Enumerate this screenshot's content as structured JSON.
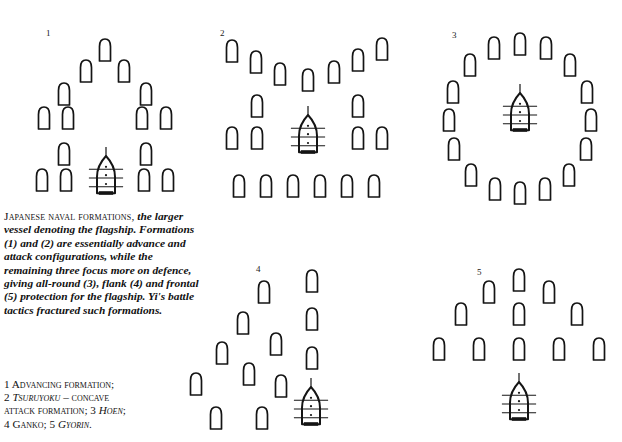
{
  "page": {
    "background_color": "#ffffff",
    "ink_color": "#141414",
    "width": 622,
    "height": 442
  },
  "figure": {
    "title_smallcaps": "Japanese naval formations,",
    "caption_italic": " the larger vessel denoting the flagship. Formations (1) and (2) are essentially advance and attack configurations, while the remaining three focus more on defence, giving all-round (3), flank (4) and frontal (5) protection for the flagship. Yi's battle tactics fractured such formations."
  },
  "legend": {
    "items": [
      {
        "number": "1",
        "name": "Advancing formation",
        "name_style": "smallcaps",
        "suffix": ";"
      },
      {
        "number": "2",
        "name": "Tsuruyoku",
        "name_style": "smallcaps-italic",
        "suffix": " – concave"
      },
      {
        "number": "",
        "name": "attack formation",
        "name_style": "smallcaps",
        "suffix": ";"
      },
      {
        "number": "3",
        "name": "Hoen",
        "name_style": "smallcaps-italic",
        "suffix": ";"
      },
      {
        "number": "4",
        "name": "Ganko",
        "name_style": "smallcaps",
        "suffix": ";"
      },
      {
        "number": "5",
        "name": "Gyorin",
        "name_style": "smallcaps-italic",
        "suffix": "."
      }
    ],
    "line1": "1 Advancing formation;",
    "line2_num": "2 ",
    "line2_it": "Tsuruyoku",
    "line2_rest": " – concave",
    "line3_a": "attack formation; 3 ",
    "line3_it": "Hoen",
    "line3_b": ";",
    "line4_a": "4 Ganko; 5 ",
    "line4_it": "Gyorin",
    "line4_b": "."
  },
  "formations": [
    {
      "id": "formation-1",
      "label": "1",
      "name": "Advancing formation",
      "label_x": 46,
      "label_y": 29,
      "x": 8,
      "y": 18,
      "w": 196,
      "h": 192,
      "flagship": {
        "cx": 98,
        "cy": 158
      },
      "ships": [
        {
          "cx": 97,
          "cy": 32
        },
        {
          "cx": 78,
          "cy": 53
        },
        {
          "cx": 116,
          "cy": 53
        },
        {
          "cx": 56,
          "cy": 76
        },
        {
          "cx": 138,
          "cy": 76
        },
        {
          "cx": 36,
          "cy": 100
        },
        {
          "cx": 60,
          "cy": 100
        },
        {
          "cx": 134,
          "cy": 100
        },
        {
          "cx": 158,
          "cy": 100
        },
        {
          "cx": 56,
          "cy": 136
        },
        {
          "cx": 138,
          "cy": 136
        },
        {
          "cx": 34,
          "cy": 162
        },
        {
          "cx": 58,
          "cy": 162
        },
        {
          "cx": 136,
          "cy": 162
        },
        {
          "cx": 160,
          "cy": 162
        }
      ]
    },
    {
      "id": "formation-2",
      "label": "2",
      "name": "Tsuruyoku – concave attack formation",
      "label_x": 220,
      "label_y": 29,
      "x": 208,
      "y": 18,
      "w": 196,
      "h": 192,
      "flagship": {
        "cx": 100,
        "cy": 117
      },
      "ships": [
        {
          "cx": 24,
          "cy": 33
        },
        {
          "cx": 48,
          "cy": 44
        },
        {
          "cx": 72,
          "cy": 56
        },
        {
          "cx": 100,
          "cy": 62
        },
        {
          "cx": 126,
          "cy": 54
        },
        {
          "cx": 150,
          "cy": 42
        },
        {
          "cx": 174,
          "cy": 31
        },
        {
          "cx": 49,
          "cy": 88
        },
        {
          "cx": 150,
          "cy": 88
        },
        {
          "cx": 24,
          "cy": 120
        },
        {
          "cx": 49,
          "cy": 120
        },
        {
          "cx": 150,
          "cy": 120
        },
        {
          "cx": 174,
          "cy": 120
        },
        {
          "cx": 31,
          "cy": 168
        },
        {
          "cx": 58,
          "cy": 168
        },
        {
          "cx": 85,
          "cy": 168
        },
        {
          "cx": 112,
          "cy": 168
        },
        {
          "cx": 139,
          "cy": 168
        },
        {
          "cx": 166,
          "cy": 168
        }
      ]
    },
    {
      "id": "formation-3",
      "label": "3",
      "name": "Hoen",
      "label_x": 452,
      "label_y": 31,
      "x": 424,
      "y": 18,
      "w": 192,
      "h": 192,
      "flagship": {
        "cx": 96,
        "cy": 95
      },
      "ships": [
        {
          "cx": 96,
          "cy": 26
        },
        {
          "cx": 70,
          "cy": 30
        },
        {
          "cx": 122,
          "cy": 30
        },
        {
          "cx": 46,
          "cy": 47
        },
        {
          "cx": 146,
          "cy": 47
        },
        {
          "cx": 29,
          "cy": 74
        },
        {
          "cx": 163,
          "cy": 74
        },
        {
          "cx": 25,
          "cy": 102
        },
        {
          "cx": 167,
          "cy": 102
        },
        {
          "cx": 30,
          "cy": 131
        },
        {
          "cx": 162,
          "cy": 131
        },
        {
          "cx": 47,
          "cy": 157
        },
        {
          "cx": 145,
          "cy": 157
        },
        {
          "cx": 71,
          "cy": 171
        },
        {
          "cx": 121,
          "cy": 171
        },
        {
          "cx": 96,
          "cy": 175
        }
      ]
    },
    {
      "id": "formation-4",
      "label": "4",
      "name": "Ganko",
      "label_x": 256,
      "label_y": 265,
      "x": 186,
      "y": 252,
      "w": 192,
      "h": 190,
      "flagship": {
        "cx": 125,
        "cy": 155
      },
      "ships": [
        {
          "cx": 126,
          "cy": 29
        },
        {
          "cx": 126,
          "cy": 67
        },
        {
          "cx": 126,
          "cy": 106
        },
        {
          "cx": 78,
          "cy": 40
        },
        {
          "cx": 57,
          "cy": 71
        },
        {
          "cx": 90,
          "cy": 92
        },
        {
          "cx": 36,
          "cy": 101
        },
        {
          "cx": 63,
          "cy": 122
        },
        {
          "cx": 95,
          "cy": 134
        },
        {
          "cx": 10,
          "cy": 132
        },
        {
          "cx": 30,
          "cy": 166
        },
        {
          "cx": 76,
          "cy": 166
        }
      ]
    },
    {
      "id": "formation-5",
      "label": "5",
      "name": "Gyorin",
      "label_x": 477,
      "label_y": 268,
      "x": 422,
      "y": 252,
      "w": 196,
      "h": 190,
      "flagship": {
        "cx": 97,
        "cy": 150
      },
      "ships": [
        {
          "cx": 97,
          "cy": 28
        },
        {
          "cx": 67,
          "cy": 40
        },
        {
          "cx": 127,
          "cy": 40
        },
        {
          "cx": 97,
          "cy": 62
        },
        {
          "cx": 39,
          "cy": 62
        },
        {
          "cx": 155,
          "cy": 62
        },
        {
          "cx": 17,
          "cy": 97
        },
        {
          "cx": 57,
          "cy": 97
        },
        {
          "cx": 97,
          "cy": 97
        },
        {
          "cx": 137,
          "cy": 97
        },
        {
          "cx": 177,
          "cy": 97
        }
      ]
    }
  ],
  "ship_glyph": {
    "regular_label": "vessel",
    "flagship_label": "flagship vessel",
    "regular_width": 11,
    "regular_height": 22,
    "flagship_width": 18,
    "flagship_height": 40,
    "flagship_crossbars": 3,
    "flagship_dots": 3
  }
}
